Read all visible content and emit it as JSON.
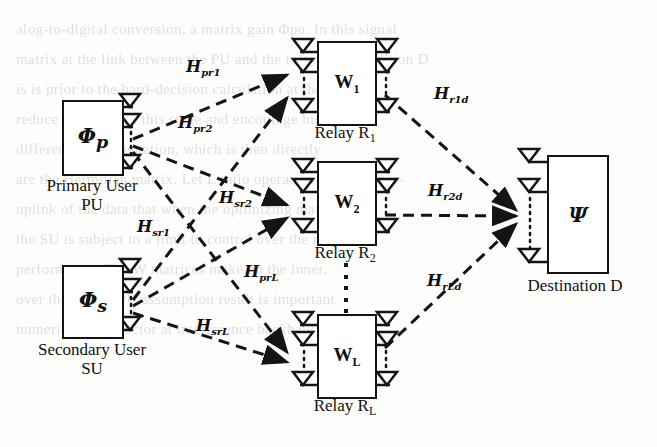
{
  "figure": {
    "type": "wireless-relay-network-diagram"
  },
  "sources": [
    {
      "id": "primary-user",
      "symbol": "Φ",
      "subscript": "p",
      "caption_line1": "Primary User",
      "caption_line2": "PU",
      "antennas": 3
    },
    {
      "id": "secondary-user",
      "symbol": "Φ",
      "subscript": "s",
      "caption_line1": "Secondary User",
      "caption_line2": "SU",
      "antennas": 3
    }
  ],
  "relays": [
    {
      "id": "relay-1",
      "matrix": "W",
      "matrix_sub": "1",
      "caption": "Relay R",
      "caption_sub": "1",
      "antennas_in": 3,
      "antennas_out": 3
    },
    {
      "id": "relay-2",
      "matrix": "W",
      "matrix_sub": "2",
      "caption": "Relay R",
      "caption_sub": "2",
      "antennas_in": 3,
      "antennas_out": 3
    },
    {
      "id": "relay-L",
      "matrix": "W",
      "matrix_sub": "L",
      "caption": "Relay R",
      "caption_sub": "L",
      "antennas_in": 3,
      "antennas_out": 3
    }
  ],
  "destination": {
    "id": "destination",
    "symbol": "Ψ",
    "caption": "Destination D",
    "antennas": 3
  },
  "channels": [
    {
      "id": "H-pr1",
      "label": "H",
      "sub": "pr",
      "sub2": "1",
      "from": "primary-user",
      "to": "relay-1"
    },
    {
      "id": "H-pr2",
      "label": "H",
      "sub": "pr",
      "sub2": "2",
      "from": "primary-user",
      "to": "relay-2"
    },
    {
      "id": "H-prL",
      "label": "H",
      "sub": "pr",
      "sub2": "L",
      "from": "primary-user",
      "to": "relay-L"
    },
    {
      "id": "H-sr1",
      "label": "H",
      "sub": "sr",
      "sub2": "1",
      "from": "secondary-user",
      "to": "relay-1"
    },
    {
      "id": "H-sr2",
      "label": "H",
      "sub": "sr",
      "sub2": "2",
      "from": "secondary-user",
      "to": "relay-2"
    },
    {
      "id": "H-srL",
      "label": "H",
      "sub": "sr",
      "sub2": "L",
      "from": "secondary-user",
      "to": "relay-L"
    },
    {
      "id": "H-r1d",
      "label": "H",
      "sub": "r",
      "sub2": "1",
      "sub3": "d",
      "from": "relay-1",
      "to": "destination"
    },
    {
      "id": "H-r2d",
      "label": "H",
      "sub": "r",
      "sub2": "2",
      "sub3": "d",
      "from": "relay-2",
      "to": "destination"
    },
    {
      "id": "H-rLd",
      "label": "H",
      "sub": "r",
      "sub2": "L",
      "sub3": "d",
      "from": "relay-L",
      "to": "destination"
    }
  ],
  "colors": {
    "ink": "#141414",
    "paper": "#fdfdfb",
    "ghost_text": "#c9c7c2"
  },
  "background_page_text": "alog-to-digital conversion, a matrix gain Φpu. In this signal\nmatrix at the link between the PU and the relay Rⱼ. In addition D\nis is prior to the hard-decision calculation at the re-\nreduce hardware at this stage and encourage high\ndifferent implementation, which is then directly\nare the Hermitian matrix. Let L ratio operation might be per-\nuplink of the data that when the optimizing matrix\nthe SU is subject to a limit to control over the result\nperformance. The W matrices make up the inner,\nover the noised PU assumption result is important\nnumerical flow vector at interference backhaul to a dual"
}
